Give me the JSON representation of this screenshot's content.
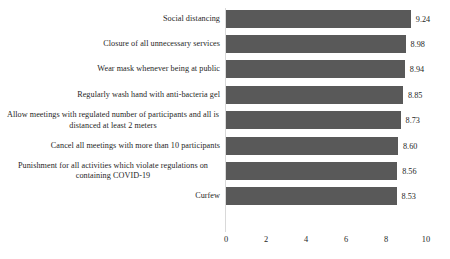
{
  "chart_data": {
    "type": "bar",
    "orientation": "horizontal",
    "title": "",
    "subtitle": "",
    "xlabel": "",
    "ylabel": "",
    "xlim": [
      0,
      10
    ],
    "grid": false,
    "legend": null,
    "bar_color": "#595959",
    "axis_color": "#d9d9d9",
    "background": "#ffffff",
    "xticks": [
      "0",
      "2",
      "4",
      "6",
      "8",
      "10"
    ],
    "xtick_values": [
      0,
      2,
      4,
      6,
      8,
      10
    ],
    "categories": [
      "Social distancing",
      "Closure of all unnecessary services",
      "Wear mask whenever being at public",
      "Regularly wash hand with anti-bacteria gel",
      "Allow meetings with regulated number of participants and all is distanced at least 2 meters",
      "Cancel all meetings with more than 10 participants",
      "Punishment for all activities which violate regulations on containing COVID-19",
      "Curfew"
    ],
    "values": [
      9.24,
      8.98,
      8.94,
      8.85,
      8.73,
      8.6,
      8.56,
      8.53
    ],
    "data_labels": [
      "9.24",
      "8.98",
      "8.94",
      "8.85",
      "8.73",
      "8.60",
      "8.56",
      "8.53"
    ]
  }
}
